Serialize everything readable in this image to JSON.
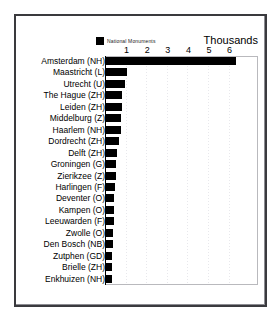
{
  "chart_data": {
    "type": "bar",
    "orientation": "horizontal",
    "title": "",
    "subtitle": "",
    "units_caption": "Thousands",
    "xlabel": "",
    "ylabel": "",
    "xlim": [
      0,
      7.4
    ],
    "xticks": [
      1,
      2,
      3,
      4,
      5,
      6
    ],
    "xtick_labels": [
      "1",
      "2",
      "3",
      "4",
      "5",
      "6"
    ],
    "grid": true,
    "grid_style": "dotted-vertical",
    "legend": {
      "position": "top-left",
      "entries": [
        {
          "label": "National Monuments",
          "color": "#000000"
        }
      ]
    },
    "series": [
      {
        "name": "National Monuments",
        "color": "#000000",
        "values": [
          6.3,
          1.02,
          0.93,
          0.79,
          0.78,
          0.75,
          0.73,
          0.62,
          0.52,
          0.5,
          0.48,
          0.43,
          0.4,
          0.39,
          0.37,
          0.34,
          0.33,
          0.31,
          0.3,
          0.29
        ]
      }
    ],
    "categories": [
      "Amsterdam (NH)",
      "Maastricht (L)",
      "Utrecht (U)",
      "The Hague (ZH)",
      "Leiden (ZH)",
      "Middelburg (Z)",
      "Haarlem (NH)",
      "Dordrecht (ZH)",
      "Delft (ZH)",
      "Groningen (G)",
      "Zierikzee (Z)",
      "Harlingen (F)",
      "Deventer (O)",
      "Kampen (O)",
      "Leeuwarden (F)",
      "Zwolle (O)",
      "Den Bosch (NB)",
      "Zutphen (GD)",
      "Brielle (ZH)",
      "Enkhuizen (NH)"
    ]
  },
  "style": {
    "bar_color": "#000000",
    "frame_color": "#3a3a3e",
    "plot_border_color": "#b9b9bd",
    "gridline_color": "#e8e8ec",
    "background": "#ffffff",
    "text_color": "#000000"
  }
}
